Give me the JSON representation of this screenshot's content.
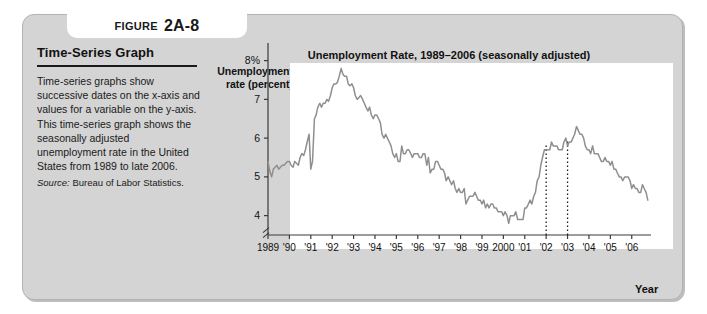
{
  "figure": {
    "label_word": "FIGURE",
    "number": "2A-8",
    "heading": "Time-Series Graph",
    "caption": "Time-series graphs show successive dates on the x-axis and values for a variable on the y-axis. This time-series graph shows the seasonally adjusted unemployment rate in the United States from 1989 to late 2006.",
    "source_label": "Source:",
    "source_text": "Bureau of Labor Statistics."
  },
  "chart_data": {
    "type": "line",
    "title": "Unemployment Rate, 1989–2006 (seasonally adjusted)",
    "xlabel": "Year",
    "ylabel": "Unemployment rate (percent)",
    "ylim": [
      3.5,
      8.3
    ],
    "xlim": [
      1989,
      2006.9
    ],
    "grid": false,
    "legend": "none",
    "axis_break": true,
    "ytick_labels": [
      "8%",
      "7",
      "6",
      "5",
      "4"
    ],
    "ytick_values": [
      8,
      7,
      6,
      5,
      4
    ],
    "xtick_labels": [
      "1989",
      "'90",
      "'91",
      "'92",
      "'93",
      "'94",
      "'95",
      "'96",
      "'97",
      "'98",
      "'99",
      "2000",
      "'01",
      "'02",
      "'03",
      "'04",
      "'05",
      "'06"
    ],
    "xtick_values": [
      1989,
      1990,
      1991,
      1992,
      1993,
      1994,
      1995,
      1996,
      1997,
      1998,
      1999,
      2000,
      2001,
      2002,
      2003,
      2004,
      2005,
      2006
    ],
    "annotations": [
      {
        "name": "dotted-line-2002",
        "x": 2002.0,
        "y_top": 5.85,
        "style": "dotted-vertical"
      },
      {
        "name": "dotted-line-2003",
        "x": 2003.0,
        "y_top": 5.95,
        "style": "dotted-vertical"
      }
    ],
    "series": [
      {
        "name": "Unemployment rate",
        "color": "#8f8f8f",
        "x": [
          1989.0,
          1989.08,
          1989.17,
          1989.25,
          1989.33,
          1989.42,
          1989.5,
          1989.58,
          1989.67,
          1989.75,
          1989.83,
          1989.92,
          1990.0,
          1990.08,
          1990.17,
          1990.25,
          1990.33,
          1990.42,
          1990.5,
          1990.58,
          1990.67,
          1990.75,
          1990.83,
          1990.92,
          1991.0,
          1991.08,
          1991.17,
          1991.25,
          1991.33,
          1991.42,
          1991.5,
          1991.58,
          1991.67,
          1991.75,
          1991.83,
          1991.92,
          1992.0,
          1992.08,
          1992.17,
          1992.25,
          1992.33,
          1992.42,
          1992.5,
          1992.58,
          1992.67,
          1992.75,
          1992.83,
          1992.92,
          1993.0,
          1993.08,
          1993.17,
          1993.25,
          1993.33,
          1993.42,
          1993.5,
          1993.58,
          1993.67,
          1993.75,
          1993.83,
          1993.92,
          1994.0,
          1994.08,
          1994.17,
          1994.25,
          1994.33,
          1994.42,
          1994.5,
          1994.58,
          1994.67,
          1994.75,
          1994.83,
          1994.92,
          1995.0,
          1995.08,
          1995.17,
          1995.25,
          1995.33,
          1995.42,
          1995.5,
          1995.58,
          1995.67,
          1995.75,
          1995.83,
          1995.92,
          1996.0,
          1996.08,
          1996.17,
          1996.25,
          1996.33,
          1996.42,
          1996.5,
          1996.58,
          1996.67,
          1996.75,
          1996.83,
          1996.92,
          1997.0,
          1997.08,
          1997.17,
          1997.25,
          1997.33,
          1997.42,
          1997.5,
          1997.58,
          1997.67,
          1997.75,
          1997.83,
          1997.92,
          1998.0,
          1998.08,
          1998.17,
          1998.25,
          1998.33,
          1998.42,
          1998.5,
          1998.58,
          1998.67,
          1998.75,
          1998.83,
          1998.92,
          1999.0,
          1999.08,
          1999.17,
          1999.25,
          1999.33,
          1999.42,
          1999.5,
          1999.58,
          1999.67,
          1999.75,
          1999.83,
          1999.92,
          2000.0,
          2000.08,
          2000.17,
          2000.25,
          2000.33,
          2000.42,
          2000.5,
          2000.58,
          2000.67,
          2000.75,
          2000.83,
          2000.92,
          2001.0,
          2001.08,
          2001.17,
          2001.25,
          2001.33,
          2001.42,
          2001.5,
          2001.58,
          2001.67,
          2001.75,
          2001.83,
          2001.92,
          2002.0,
          2002.08,
          2002.17,
          2002.25,
          2002.33,
          2002.42,
          2002.5,
          2002.58,
          2002.67,
          2002.75,
          2002.83,
          2002.92,
          2003.0,
          2003.08,
          2003.17,
          2003.25,
          2003.33,
          2003.42,
          2003.5,
          2003.58,
          2003.67,
          2003.75,
          2003.83,
          2003.92,
          2004.0,
          2004.08,
          2004.17,
          2004.25,
          2004.33,
          2004.42,
          2004.5,
          2004.58,
          2004.67,
          2004.75,
          2004.83,
          2004.92,
          2005.0,
          2005.08,
          2005.17,
          2005.25,
          2005.33,
          2005.42,
          2005.5,
          2005.58,
          2005.67,
          2005.75,
          2005.83,
          2005.92,
          2006.0,
          2006.08,
          2006.17,
          2006.25,
          2006.33,
          2006.42,
          2006.5,
          2006.58,
          2006.67,
          2006.75
        ],
        "values": [
          5.4,
          5.15,
          5.0,
          5.2,
          5.25,
          5.3,
          5.2,
          5.25,
          5.3,
          5.3,
          5.35,
          5.4,
          5.4,
          5.3,
          5.25,
          5.4,
          5.35,
          5.3,
          5.5,
          5.6,
          5.55,
          5.7,
          5.9,
          6.1,
          5.2,
          5.4,
          6.5,
          6.6,
          6.8,
          6.9,
          6.8,
          6.9,
          6.9,
          7.0,
          6.95,
          7.1,
          7.3,
          7.4,
          7.4,
          7.45,
          7.6,
          7.8,
          7.65,
          7.6,
          7.6,
          7.4,
          7.35,
          7.4,
          7.3,
          7.1,
          7.0,
          7.05,
          7.1,
          7.0,
          6.9,
          6.8,
          6.7,
          6.8,
          6.6,
          6.5,
          6.6,
          6.6,
          6.5,
          6.4,
          6.1,
          6.0,
          6.1,
          6.0,
          5.9,
          5.8,
          5.6,
          5.5,
          5.6,
          5.4,
          5.4,
          5.8,
          5.6,
          5.6,
          5.7,
          5.7,
          5.6,
          5.5,
          5.6,
          5.6,
          5.6,
          5.5,
          5.5,
          5.6,
          5.6,
          5.3,
          5.5,
          5.1,
          5.2,
          5.2,
          5.4,
          5.4,
          5.3,
          5.2,
          5.2,
          5.1,
          4.9,
          5.0,
          4.9,
          4.8,
          4.9,
          4.7,
          4.6,
          4.7,
          4.6,
          4.6,
          4.7,
          4.3,
          4.4,
          4.5,
          4.5,
          4.5,
          4.6,
          4.5,
          4.4,
          4.4,
          4.3,
          4.4,
          4.2,
          4.3,
          4.2,
          4.3,
          4.3,
          4.2,
          4.2,
          4.1,
          4.1,
          4.1,
          4.0,
          4.1,
          4.0,
          3.8,
          4.0,
          4.0,
          4.0,
          4.1,
          3.9,
          3.9,
          3.9,
          3.9,
          4.2,
          4.2,
          4.3,
          4.4,
          4.3,
          4.5,
          4.6,
          4.9,
          5.0,
          5.3,
          5.5,
          5.7,
          5.7,
          5.7,
          5.7,
          5.9,
          5.8,
          5.8,
          5.8,
          5.7,
          5.7,
          5.7,
          5.9,
          6.0,
          5.8,
          5.9,
          5.9,
          6.0,
          6.1,
          6.3,
          6.2,
          6.1,
          6.1,
          6.0,
          5.8,
          5.7,
          5.7,
          5.6,
          5.8,
          5.6,
          5.6,
          5.6,
          5.5,
          5.4,
          5.4,
          5.5,
          5.4,
          5.4,
          5.3,
          5.4,
          5.2,
          5.2,
          5.1,
          5.0,
          5.0,
          4.9,
          5.0,
          5.0,
          5.0,
          4.9,
          4.7,
          4.8,
          4.7,
          4.7,
          4.6,
          4.6,
          4.8,
          4.7,
          4.6,
          4.4
        ]
      }
    ]
  }
}
